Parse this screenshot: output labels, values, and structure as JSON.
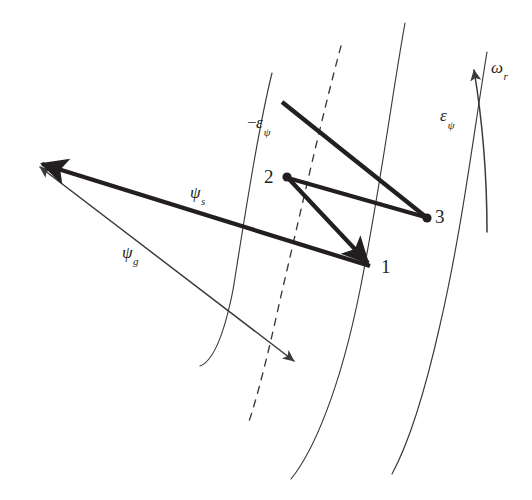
{
  "figure": {
    "background_color": "#ffffff",
    "ink_color": "#231f20",
    "labels": {
      "point_1": "1",
      "point_2": "2",
      "point_3": "3",
      "flux_stator": "ψ",
      "flux_stator_sub": "s",
      "flux_gap": "ψ",
      "flux_gap_sub": "g",
      "eps_neg_sign": "−",
      "eps_neg_symbol": "ε",
      "eps_neg_sub": "ψ",
      "eps_pos_symbol": "ε",
      "eps_pos_sub": "ψ",
      "omega_symbol": "ω",
      "omega_sub": "r"
    },
    "geometry": {
      "arcs": [
        {
          "name": "arc-inner-solid",
          "style": "solid",
          "stroke_width": 1.1,
          "path": "M 272 73 C 258 130 245 215 233 290 C 223 340 211 362 200 366"
        },
        {
          "name": "arc-middle-dashed",
          "style": "dashed",
          "stroke_width": 1.3,
          "dash": "7 7",
          "path": "M 341 46 C 321 120 300 215 280 300 C 268 355 256 402 248 424"
        },
        {
          "name": "arc-outer-solid",
          "style": "solid",
          "stroke_width": 1.1,
          "path": "M 405 23 C 392 95 380 190 360 290 C 340 390 313 452 291 479"
        },
        {
          "name": "arc-far-solid",
          "style": "solid",
          "stroke_width": 1.1,
          "path": "M 487 52 C 474 130 462 230 440 325 C 422 405 405 450 392 474"
        }
      ],
      "vectors": [
        {
          "name": "psi-s-vector",
          "from": [
            372,
            267
          ],
          "to": [
            36,
            163
          ],
          "thick": true,
          "arrow": "end"
        },
        {
          "name": "psi-g-line",
          "from": [
            36,
            164
          ],
          "to": [
            297,
            363
          ],
          "thick": false,
          "arrow": "both"
        },
        {
          "name": "segment-top-to-3",
          "from": [
            282,
            102
          ],
          "to": [
            427,
            218
          ],
          "thick": true
        },
        {
          "name": "segment-2-to-3",
          "from": [
            287,
            177
          ],
          "to": [
            427,
            218
          ],
          "thick": true
        },
        {
          "name": "segment-2-to-1",
          "from": [
            287,
            177
          ],
          "to": [
            372,
            267
          ],
          "thick": true,
          "arrow": "end"
        }
      ],
      "nodes": [
        {
          "name": "node-2",
          "at": [
            287,
            177
          ],
          "radius": 4.4
        },
        {
          "name": "node-3",
          "at": [
            427,
            218
          ],
          "radius": 4.4
        }
      ],
      "omega_arc": {
        "name": "omega-r-arc",
        "path": "M 486 230 C 486 170 480 110 473 68",
        "arrow": "end"
      }
    },
    "label_positions": {
      "point_1": [
        381,
        258
      ],
      "point_2": [
        265,
        167
      ],
      "point_3": [
        434,
        208
      ],
      "flux_stator": [
        191,
        185
      ],
      "flux_gap": [
        123,
        245
      ],
      "eps_neg": [
        248,
        115
      ],
      "eps_pos": [
        441,
        108
      ],
      "omega_r": [
        491,
        60
      ]
    }
  }
}
